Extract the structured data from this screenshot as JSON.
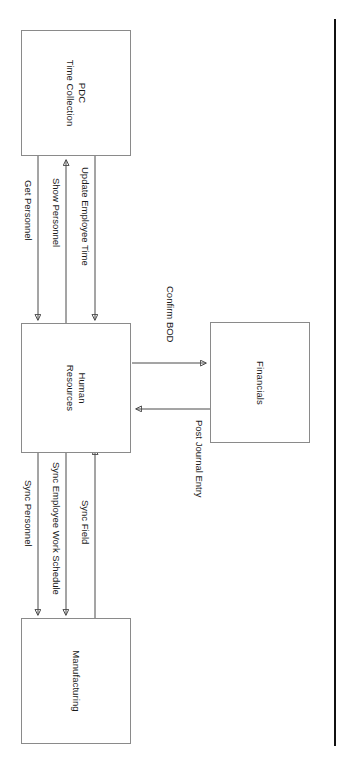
{
  "diagram": {
    "type": "system-integration-flow",
    "orientation": "rotated-90-clockwise",
    "nodes": [
      {
        "id": "pdc",
        "label": "PDC\nTime Collection",
        "line1": "PDC",
        "line2": "Time Collection"
      },
      {
        "id": "hr",
        "label": "Human\nResources",
        "line1": "Human",
        "line2": "Resources"
      },
      {
        "id": "financials",
        "label": "Financials",
        "line1": "Financials",
        "line2": ""
      },
      {
        "id": "manufacturing",
        "label": "Manufacturing",
        "line1": "Manufacturing",
        "line2": ""
      }
    ],
    "edges": [
      {
        "id": "get-personnel",
        "label": "Get Personnel",
        "from": "pdc",
        "to": "hr",
        "direction": "one-way"
      },
      {
        "id": "show-personnel",
        "label": "Show Personnel",
        "from": "hr",
        "to": "pdc",
        "direction": "one-way"
      },
      {
        "id": "update-employee-time",
        "label": "Update Employee Time",
        "from": "pdc",
        "to": "hr",
        "direction": "one-way"
      },
      {
        "id": "confirm-bod",
        "label": "Confirm BOD",
        "from": "hr",
        "to": "financials",
        "direction": "one-way"
      },
      {
        "id": "post-journal-entry",
        "label": "Post Journal Entry",
        "from": "financials",
        "to": "hr",
        "direction": "one-way"
      },
      {
        "id": "sync-personnel",
        "label": "Sync Personnel",
        "from": "hr",
        "to": "manufacturing",
        "direction": "one-way"
      },
      {
        "id": "sync-employee-work-schedule",
        "label": "Sync Employee Work Schedule",
        "from": "hr",
        "to": "manufacturing",
        "direction": "two-way"
      },
      {
        "id": "sync-field",
        "label": "Sync Field",
        "from": "manufacturing",
        "to": "hr",
        "direction": "one-way"
      }
    ],
    "colors": {
      "box_border": "#8a8a8a",
      "connector": "#4a4a4a",
      "text": "#1a1a1a",
      "page_edge": "#111111",
      "background": "#ffffff"
    }
  }
}
